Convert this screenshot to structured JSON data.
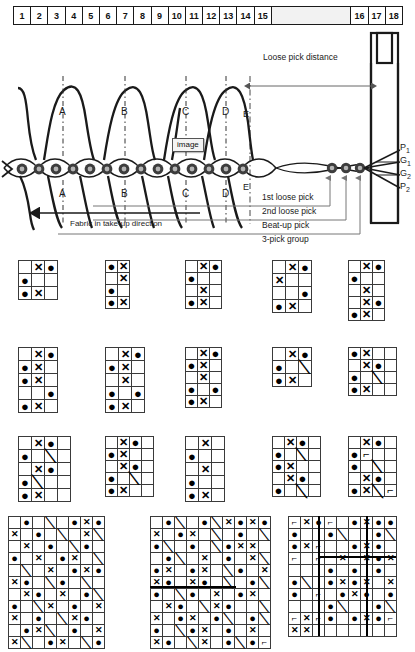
{
  "ruler": {
    "name": "scale-ruler",
    "cells": [
      "1",
      "2",
      "3",
      "4",
      "5",
      "6",
      "7",
      "8",
      "9",
      "10",
      "11",
      "12",
      "13",
      "14",
      "15",
      "",
      "16",
      "17",
      "18"
    ],
    "wide_index": 15
  },
  "diagram": {
    "loose_pick_distance_label": "Loose pick distance",
    "take_up_label": "Fabric in take-up direction",
    "e_label_top": "E",
    "e_label_bottom": "E",
    "image_tooltip": "image",
    "arc_letters_top": [
      "A",
      "B",
      "C",
      "D"
    ],
    "arc_letters_bottom": [
      "A",
      "B",
      "C",
      "D"
    ],
    "yarn_labels": [
      "P",
      "G",
      "G",
      "P"
    ],
    "yarn_subscripts": [
      "1",
      "1",
      "2",
      "2"
    ],
    "pick_annotations": [
      "1st loose pick",
      "2nd loose pick",
      "Beat-up pick",
      "3-pick group"
    ]
  },
  "colors": {
    "ink": "#1a1a1a",
    "grid_line": "#3a3a3a",
    "ruler_fill_wide": "#f2f2f2",
    "tooltip_fill": "#f4f4f4"
  },
  "weave_rows": [
    {
      "row_name": "weave-grid-row-1",
      "grids": [
        {
          "name": "weave-grid-r1-c1",
          "cols": 3,
          "rows": 3,
          "cell": 13,
          "marks": [
            [
              "",
              "x",
              "dot"
            ],
            [
              "dot",
              "",
              ""
            ],
            [
              "dot",
              "x",
              ""
            ]
          ]
        },
        {
          "name": "weave-grid-r1-c2",
          "cols": 2,
          "rows": 4,
          "cell": 12,
          "marks": [
            [
              "dot",
              "x"
            ],
            [
              "",
              "x"
            ],
            [
              "dot",
              ""
            ],
            [
              "dot",
              "x"
            ]
          ]
        },
        {
          "name": "weave-grid-r1-c3",
          "cols": 3,
          "rows": 4,
          "cell": 12,
          "marks": [
            [
              "",
              "x",
              "dot"
            ],
            [
              "dot",
              "",
              ""
            ],
            [
              "",
              "x",
              ""
            ],
            [
              "dot",
              "x",
              ""
            ]
          ]
        },
        {
          "name": "weave-grid-r1-c4",
          "cols": 3,
          "rows": 4,
          "cell": 13,
          "marks": [
            [
              "",
              "x",
              "dot"
            ],
            [
              "x",
              "",
              ""
            ],
            [
              "",
              "",
              "dot"
            ],
            [
              "dot",
              "x",
              ""
            ]
          ]
        },
        {
          "name": "weave-grid-r1-c5",
          "cols": 3,
          "rows": 5,
          "cell": 12,
          "marks": [
            [
              "",
              "x",
              "dot"
            ],
            [
              "dot",
              "",
              ""
            ],
            [
              "",
              "x",
              ""
            ],
            [
              "",
              "x",
              "dot"
            ],
            [
              "dot",
              "x",
              ""
            ]
          ]
        }
      ]
    },
    {
      "row_name": "weave-grid-row-2",
      "grids": [
        {
          "name": "weave-grid-r2-c1",
          "cols": 3,
          "rows": 5,
          "cell": 13,
          "marks": [
            [
              "",
              "x",
              "dot"
            ],
            [
              "dot",
              "x",
              ""
            ],
            [
              "dot",
              "x",
              ""
            ],
            [
              "",
              "",
              "dot"
            ],
            [
              "dot",
              "x",
              ""
            ]
          ]
        },
        {
          "name": "weave-grid-r2-c2",
          "cols": 3,
          "rows": 5,
          "cell": 13,
          "marks": [
            [
              "",
              "x",
              "dot"
            ],
            [
              "dot",
              "x",
              ""
            ],
            [
              "",
              "x",
              ""
            ],
            [
              "dot",
              "",
              "dot"
            ],
            [
              "dot",
              "x",
              ""
            ]
          ]
        },
        {
          "name": "weave-grid-r2-c3",
          "cols": 3,
          "rows": 5,
          "cell": 12,
          "marks": [
            [
              "",
              "x",
              "dot"
            ],
            [
              "dot",
              "x",
              ""
            ],
            [
              "",
              "x",
              ""
            ],
            [
              "dot",
              "",
              "dot"
            ],
            [
              "dot",
              "x",
              ""
            ]
          ]
        },
        {
          "name": "weave-grid-r2-c4",
          "cols": 3,
          "rows": 3,
          "cell": 13,
          "marks": [
            [
              "",
              "x",
              "dot"
            ],
            [
              "dot",
              "",
              "slash"
            ],
            [
              "dot",
              "x",
              ""
            ]
          ]
        },
        {
          "name": "weave-grid-r2-c5",
          "cols": 4,
          "rows": 4,
          "cell": 12,
          "marks": [
            [
              "dot",
              "x",
              "",
              ""
            ],
            [
              "",
              "x",
              "dot",
              ""
            ],
            [
              "dot",
              "",
              "slash",
              ""
            ],
            [
              "dot",
              "x",
              "",
              ""
            ]
          ]
        }
      ]
    },
    {
      "row_name": "weave-grid-row-3",
      "grids": [
        {
          "name": "weave-grid-r3-c1",
          "cols": 4,
          "rows": 5,
          "cell": 13,
          "marks": [
            [
              "",
              "x",
              "dot",
              ""
            ],
            [
              "dot",
              "",
              "slash",
              ""
            ],
            [
              "",
              "x",
              "dot",
              ""
            ],
            [
              "dot",
              "slash",
              "",
              ""
            ],
            [
              "dot",
              "x",
              "",
              ""
            ]
          ]
        },
        {
          "name": "weave-grid-r3-c2",
          "cols": 4,
          "rows": 5,
          "cell": 12,
          "marks": [
            [
              "",
              "x",
              "dot",
              ""
            ],
            [
              "dot",
              "x",
              "",
              ""
            ],
            [
              "",
              "x",
              "dot",
              ""
            ],
            [
              "dot",
              "",
              "slash",
              ""
            ],
            [
              "dot",
              "x",
              "",
              ""
            ]
          ]
        },
        {
          "name": "weave-grid-r3-c3",
          "cols": 3,
          "rows": 5,
          "cell": 13,
          "marks": [
            [
              "",
              "x",
              ""
            ],
            [
              "dot",
              "",
              ""
            ],
            [
              "",
              "x",
              ""
            ],
            [
              "dot",
              "",
              ""
            ],
            [
              "dot",
              "x",
              ""
            ]
          ]
        },
        {
          "name": "weave-grid-r3-c4",
          "cols": 4,
          "rows": 5,
          "cell": 12,
          "marks": [
            [
              "",
              "x",
              "dot",
              ""
            ],
            [
              "dot",
              "",
              "slash",
              ""
            ],
            [
              "dot",
              "x",
              "",
              ""
            ],
            [
              "",
              "x",
              "dot",
              ""
            ],
            [
              "dot",
              "",
              "slash",
              ""
            ]
          ]
        },
        {
          "name": "weave-grid-r3-c5",
          "cols": 4,
          "rows": 5,
          "cell": 12,
          "marks": [
            [
              "",
              "x",
              "dot",
              ""
            ],
            [
              "dot",
              "corner",
              "",
              ""
            ],
            [
              "dot",
              "",
              "slash",
              ""
            ],
            [
              "",
              "x",
              "dot",
              ""
            ],
            [
              "dot",
              "x",
              "slash",
              "corner"
            ]
          ]
        }
      ]
    }
  ],
  "weave_big": [
    {
      "name": "weave-grid-big-1",
      "cols": 8,
      "rows": 11,
      "cell": 12,
      "marks": [
        [
          "",
          "dot",
          "",
          "slash",
          "",
          "dot",
          "x",
          "dot"
        ],
        [
          "x",
          "",
          "dot",
          "",
          "slash",
          "",
          "x",
          "slash"
        ],
        [
          "",
          "x",
          "",
          "dot",
          "",
          "slash",
          "dot",
          ""
        ],
        [
          "dot",
          "",
          "x",
          "",
          "dot",
          "x",
          "",
          "slash"
        ],
        [
          "",
          "slash",
          "",
          "x",
          "",
          "dot",
          "x",
          "dot"
        ],
        [
          "x",
          "dot",
          "",
          "slash",
          "dot",
          "",
          "slash",
          ""
        ],
        [
          "",
          "x",
          "dot",
          "",
          "x",
          "",
          "dot",
          "slash"
        ],
        [
          "dot",
          "",
          "slash",
          "x",
          "",
          "dot",
          "",
          "x"
        ],
        [
          "x",
          "",
          "dot",
          "",
          "slash",
          "x",
          "dot",
          ""
        ],
        [
          "",
          "dot",
          "x",
          "slash",
          "",
          "dot",
          "",
          "x"
        ],
        [
          "x",
          "slash",
          "",
          "dot",
          "x",
          "",
          "slash",
          "dot"
        ]
      ]
    },
    {
      "name": "weave-grid-big-2",
      "cols": 10,
      "rows": 11,
      "cell": 12,
      "marks": [
        [
          "",
          "dot",
          "slash",
          "",
          "dot",
          "slash",
          "x",
          "dot",
          "x",
          "dot"
        ],
        [
          "x",
          "",
          "dot",
          "x",
          "",
          "slash",
          "",
          "dot",
          "",
          "slash"
        ],
        [
          "dot",
          "slash",
          "",
          "dot",
          "",
          "slash",
          "dot",
          "x",
          "x",
          ""
        ],
        [
          "",
          "dot",
          "slash",
          "",
          "x",
          "",
          "dot",
          "",
          "x",
          "slash"
        ],
        [
          "dot",
          "x",
          "",
          "dot",
          "x",
          "",
          "slash",
          "dot",
          "",
          "x"
        ],
        [
          "x",
          "dot",
          "",
          "x",
          "dot",
          "",
          "slash",
          "",
          "dot",
          "slash"
        ],
        [
          "dot",
          "",
          "slash",
          "dot",
          "",
          "x",
          "",
          "dot",
          "x",
          ""
        ],
        [
          "",
          "x",
          "dot",
          "",
          "slash",
          "x",
          "dot",
          "",
          "",
          "slash"
        ],
        [
          "x",
          "",
          "dot",
          "x",
          "",
          "dot",
          "slash",
          "",
          "dot",
          "slash"
        ],
        [
          "dot",
          "",
          "slash",
          "dot",
          "x",
          "",
          "dot",
          "",
          "x",
          ""
        ],
        [
          "x",
          "dot",
          "",
          "slash",
          "x",
          "",
          "dot",
          "slash",
          "dot",
          "corner"
        ]
      ]
    },
    {
      "name": "weave-grid-big-3",
      "cols": 9,
      "rows": 10,
      "cell": 12,
      "marks": [
        [
          "corner",
          "x",
          "dot",
          "corner",
          "",
          "dot",
          "x",
          "dot",
          "dot"
        ],
        [
          "dot",
          "",
          "",
          "dot",
          "slash",
          "",
          "",
          "dot",
          "slash"
        ],
        [
          "dot",
          "x",
          "corner",
          "",
          "",
          "dot",
          "x",
          "dot",
          ""
        ],
        [
          "corner",
          "",
          "corner",
          "",
          "x",
          "",
          "x",
          "dot",
          "x"
        ],
        [
          "",
          "",
          "",
          "dot",
          "",
          "dot",
          "",
          "dot",
          ""
        ],
        [
          "dot",
          "slash",
          "",
          "dot",
          "x",
          "dot",
          "x",
          "",
          "x"
        ],
        [
          "dot",
          "",
          "corner",
          "",
          "dot",
          "x",
          "dot",
          "",
          "dot"
        ],
        [
          "",
          "",
          "",
          "dot",
          "slash",
          "",
          "",
          "dot",
          "slash"
        ],
        [
          "corner",
          "x",
          "corner",
          "dot",
          "",
          "dot",
          "x",
          "dot",
          "corner"
        ],
        [
          "x",
          "x",
          "",
          "",
          "",
          "",
          "",
          "",
          ""
        ]
      ]
    }
  ]
}
